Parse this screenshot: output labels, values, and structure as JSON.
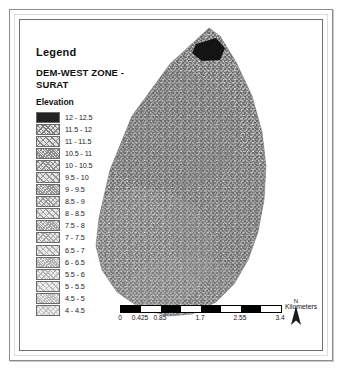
{
  "map": {
    "legend": {
      "heading": "Legend",
      "title": "DEM-WEST ZONE - SURAT",
      "subheading": "Elevation",
      "classes": [
        {
          "label": "12 - 12.5",
          "pattern": "solid-dark",
          "tone": 0.98
        },
        {
          "label": "11.5 - 12",
          "pattern": "dither",
          "tone": 0.6
        },
        {
          "label": "11 - 11.5",
          "pattern": "dither",
          "tone": 0.57
        },
        {
          "label": "10.5 - 11",
          "pattern": "dither",
          "tone": 0.55
        },
        {
          "label": "10 - 10.5",
          "pattern": "dither",
          "tone": 0.53
        },
        {
          "label": "9.5 - 10",
          "pattern": "dither",
          "tone": 0.51
        },
        {
          "label": "9 - 9.5",
          "pattern": "dither",
          "tone": 0.49
        },
        {
          "label": "8.5 - 9",
          "pattern": "dither",
          "tone": 0.47
        },
        {
          "label": "8 - 8.5",
          "pattern": "dither",
          "tone": 0.45
        },
        {
          "label": "7.5 - 8",
          "pattern": "dither",
          "tone": 0.43
        },
        {
          "label": "7 - 7.5",
          "pattern": "dither",
          "tone": 0.41
        },
        {
          "label": "6.5 - 7",
          "pattern": "dither",
          "tone": 0.39
        },
        {
          "label": "6 - 6.5",
          "pattern": "dither",
          "tone": 0.37
        },
        {
          "label": "5.5 - 6",
          "pattern": "dither",
          "tone": 0.35
        },
        {
          "label": "5 - 5.5",
          "pattern": "dither",
          "tone": 0.33
        },
        {
          "label": "4.5 - 5",
          "pattern": "dither",
          "tone": 0.31
        },
        {
          "label": "4 - 4.5",
          "pattern": "dither",
          "tone": 0.29
        }
      ]
    },
    "scalebar": {
      "unit": "Kilometers",
      "ticks": [
        "0",
        "0.425",
        "0.85",
        "1.7",
        "2.55",
        "3.4"
      ],
      "tick_positions": [
        0,
        12.5,
        25,
        50,
        75,
        100
      ],
      "segments": [
        "#000000",
        "#ffffff",
        "#000000",
        "#ffffff",
        "#000000",
        "#ffffff",
        "#000000",
        "#ffffff"
      ]
    },
    "north_arrow": {
      "label": "N"
    },
    "raster": {
      "name": "dem-west-zone-surat-raster",
      "fill_tone": "#8e8e8e",
      "peak_patch_tone": "#1a1a1a"
    }
  }
}
